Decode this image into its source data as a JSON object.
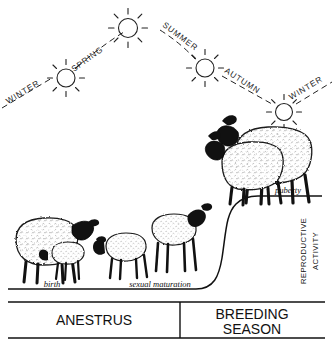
{
  "figure": {
    "title_implied": "Sheep annual reproductive cycle",
    "seasons": [
      {
        "name": "WINTER",
        "position": "left-start"
      },
      {
        "name": "SPRING",
        "position": "ascending-left"
      },
      {
        "name": "SUMMER",
        "position": "descending-right"
      },
      {
        "name": "AUTUMN",
        "position": "descending-right-lower"
      },
      {
        "name": "WINTER",
        "position": "right-end"
      }
    ],
    "suns": [
      {
        "index": 1,
        "season_after": "WINTER"
      },
      {
        "index": 2,
        "season_after": "SPRING"
      },
      {
        "index": 3,
        "season_after": "SUMMER"
      },
      {
        "index": 4,
        "season_after": "AUTUMN"
      },
      {
        "index": 5,
        "season_after": "WINTER"
      }
    ],
    "curve_labels": [
      {
        "text": "birth",
        "style": "italic"
      },
      {
        "text": "sexual  maturation",
        "style": "italic"
      },
      {
        "text": "puberty",
        "style": "italic"
      }
    ],
    "y_axis_label_line1": "REPRODUCTIVE",
    "y_axis_label_line2": "ACTIVITY",
    "phase_boxes": [
      {
        "label": "ANESTRUS",
        "lines": [
          "ANESTRUS"
        ]
      },
      {
        "label": "BREEDING SEASON",
        "lines": [
          "BREEDING",
          "SEASON"
        ]
      }
    ],
    "animal_groups": [
      {
        "name": "ewe-with-newborn-lamb",
        "stage": "birth"
      },
      {
        "name": "growing-lambs",
        "stage": "sexual maturation"
      },
      {
        "name": "adult-sheep-pair",
        "stage": "puberty"
      }
    ],
    "colors": {
      "ink": "#000000",
      "background": "#ffffff",
      "line": "#1a1a1a"
    }
  }
}
